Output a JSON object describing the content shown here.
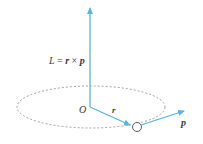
{
  "diagram": {
    "equation": {
      "L": "L",
      "eq": " = ",
      "r": "r",
      "times": " × ",
      "p": "p"
    },
    "labels": {
      "origin": "O",
      "r_vector": "r",
      "p_vector": "p"
    },
    "colors": {
      "arrow": "#5ab4dc",
      "orbit": "#8a8a8a",
      "text": "#3a3a3a",
      "particle": "#4a4a4a"
    }
  }
}
